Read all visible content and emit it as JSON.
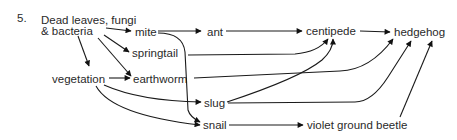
{
  "question_number": "5.",
  "nodes": {
    "dead_leaves_line1": "Dead leaves, fungi",
    "dead_leaves_line2": "& bacteria",
    "mite": "mite",
    "ant": "ant",
    "centipede": "centipede",
    "hedgehog": "hedgehog",
    "springtail": "springtail",
    "vegetation": "vegetation",
    "earthworm": "earthworm",
    "slug": "slug",
    "snail": "snail",
    "violet_ground_beetle": "violet ground beetle"
  },
  "edges": [
    [
      "Dead leaves, fungi & bacteria",
      "mite"
    ],
    [
      "Dead leaves, fungi & bacteria",
      "springtail"
    ],
    [
      "Dead leaves, fungi & bacteria",
      "earthworm"
    ],
    [
      "Dead leaves, fungi & bacteria",
      "vegetation"
    ],
    [
      "mite",
      "ant"
    ],
    [
      "mite",
      "snail"
    ],
    [
      "ant",
      "centipede"
    ],
    [
      "springtail",
      "centipede"
    ],
    [
      "slug",
      "centipede"
    ],
    [
      "centipede",
      "hedgehog"
    ],
    [
      "earthworm",
      "hedgehog"
    ],
    [
      "slug",
      "hedgehog"
    ],
    [
      "violet ground beetle",
      "hedgehog"
    ],
    [
      "vegetation",
      "earthworm"
    ],
    [
      "vegetation",
      "slug"
    ],
    [
      "vegetation",
      "snail"
    ],
    [
      "snail",
      "violet ground beetle"
    ]
  ]
}
